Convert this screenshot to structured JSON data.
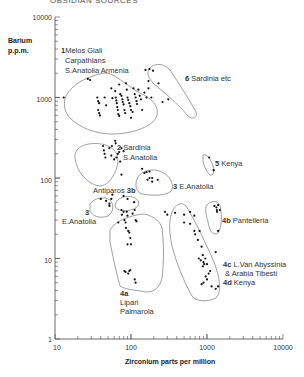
{
  "header": {
    "cut_title": "OBSIDIAN SOURCES"
  },
  "chart_data": {
    "type": "scatter",
    "title": "",
    "xlabel": "Zirconium parts per million",
    "ylabel": "Barium p.p.m.",
    "xscale": "log",
    "yscale": "log",
    "xlim": [
      10,
      10000
    ],
    "ylim": [
      1,
      10000
    ],
    "x_ticks": [
      "10",
      "100",
      "1000",
      "10000"
    ],
    "y_ticks": [
      "1",
      "10",
      "100",
      "1000",
      "10000"
    ],
    "grid": false,
    "legend": "none",
    "groups": [
      {
        "id": "1",
        "label": "1 Melos Giali Carpathians S.Anatolia Armenia",
        "label_lines": [
          "Melos Giali",
          "Carpathians",
          "S.Anatolia  Armenia"
        ],
        "points": [
          [
            13,
            1000
          ],
          [
            27,
            1700
          ],
          [
            29,
            1650
          ],
          [
            36,
            1000
          ],
          [
            37,
            900
          ],
          [
            38,
            850
          ],
          [
            37,
            700
          ],
          [
            38,
            640
          ],
          [
            39,
            600
          ],
          [
            45,
            1000
          ],
          [
            47,
            800
          ],
          [
            55,
            1300
          ],
          [
            57,
            980
          ],
          [
            62,
            1200
          ],
          [
            63,
            1000
          ],
          [
            64,
            920
          ],
          [
            65,
            850
          ],
          [
            66,
            760
          ],
          [
            67,
            700
          ],
          [
            68,
            620
          ],
          [
            70,
            1450
          ],
          [
            72,
            1100
          ],
          [
            75,
            1050
          ],
          [
            77,
            950
          ],
          [
            78,
            880
          ],
          [
            80,
            820
          ],
          [
            82,
            700
          ],
          [
            84,
            640
          ],
          [
            86,
            1500
          ],
          [
            88,
            1250
          ],
          [
            90,
            1000
          ],
          [
            92,
            930
          ],
          [
            95,
            850
          ],
          [
            98,
            780
          ],
          [
            100,
            700
          ],
          [
            105,
            660
          ],
          [
            108,
            1300
          ],
          [
            112,
            1100
          ],
          [
            115,
            1000
          ],
          [
            118,
            900
          ],
          [
            120,
            830
          ],
          [
            125,
            1250
          ],
          [
            130,
            1050
          ],
          [
            135,
            950
          ],
          [
            140,
            700
          ],
          [
            150,
            1150
          ],
          [
            160,
            1000
          ],
          [
            170,
            1300
          ],
          [
            185,
            1000
          ],
          [
            260,
            880
          ],
          [
            100,
            560
          ],
          [
            70,
            590
          ]
        ]
      },
      {
        "id": "6",
        "label": "6 Sardinia etc",
        "points": [
          [
            155,
            2200
          ],
          [
            175,
            2250
          ],
          [
            195,
            2150
          ],
          [
            170,
            1600
          ],
          [
            230,
            1500
          ],
          [
            310,
            950
          ]
        ]
      },
      {
        "id": "2",
        "label": "2 Sardinia S.Anatolia",
        "points": [
          [
            43,
            250
          ],
          [
            44,
            220
          ],
          [
            45,
            200
          ],
          [
            46,
            180
          ],
          [
            52,
            235
          ],
          [
            55,
            190
          ],
          [
            56,
            250
          ],
          [
            60,
            170
          ],
          [
            62,
            290
          ],
          [
            63,
            270
          ],
          [
            64,
            180
          ],
          [
            67,
            200
          ],
          [
            70,
            210
          ],
          [
            72,
            160
          ],
          [
            75,
            235
          ],
          [
            80,
            215
          ],
          [
            75,
            110
          ]
        ]
      },
      {
        "id": "5",
        "label": "5 Kenya",
        "points": [
          [
            1070,
            180
          ],
          [
            1220,
            125
          ]
        ]
      },
      {
        "id": "3",
        "label": "3 E.Anatolia",
        "points": [
          [
            140,
            130
          ],
          [
            150,
            115
          ],
          [
            160,
            118
          ],
          [
            175,
            120
          ],
          [
            165,
            95
          ],
          [
            175,
            100
          ],
          [
            190,
            100
          ],
          [
            190,
            90
          ],
          [
            225,
            95
          ]
        ]
      },
      {
        "id": "3b",
        "label": "Antiparos 3b",
        "points": [
          [
            80,
            60
          ],
          [
            90,
            55
          ],
          [
            110,
            50
          ]
        ]
      },
      {
        "id": "3-west",
        "label": "3 E.Anatolia",
        "points": [
          [
            40,
            55
          ],
          [
            47,
            52
          ],
          [
            52,
            48
          ],
          [
            55,
            55
          ],
          [
            57,
            62
          ],
          [
            52,
            45
          ]
        ]
      },
      {
        "id": "4a",
        "label": "4a Lipari Palmarola",
        "points": [
          [
            68,
            28
          ],
          [
            75,
            40
          ],
          [
            76,
            35
          ],
          [
            80,
            38
          ],
          [
            82,
            30
          ],
          [
            85,
            28
          ],
          [
            86,
            24
          ],
          [
            88,
            38
          ],
          [
            90,
            34
          ],
          [
            92,
            22
          ],
          [
            95,
            21
          ],
          [
            98,
            18
          ],
          [
            105,
            36
          ],
          [
            112,
            40
          ],
          [
            115,
            30
          ],
          [
            118,
            29
          ],
          [
            90,
            15
          ],
          [
            100,
            15
          ],
          [
            82,
            7
          ],
          [
            92,
            6.5
          ],
          [
            95,
            7
          ],
          [
            98,
            7.2
          ],
          [
            85,
            6.8
          ],
          [
            112,
            5.5
          ],
          [
            115,
            5
          ]
        ]
      },
      {
        "id": "4b",
        "label": "4b Pantelleria",
        "points": [
          [
            1250,
            45
          ],
          [
            1330,
            43
          ],
          [
            1350,
            40
          ],
          [
            1400,
            46
          ],
          [
            1360,
            38
          ],
          [
            1480,
            40
          ],
          [
            1400,
            22
          ]
        ]
      },
      {
        "id": "4c-4d",
        "label": "4c L.Van Abyssinia & Arabia Tibesti 4d Kenya",
        "label_lines": [
          "L.Van  Abyssinia",
          "& Arabia  Tibesti",
          "Kenya"
        ],
        "points": [
          [
            280,
            38
          ],
          [
            300,
            35
          ],
          [
            380,
            37
          ],
          [
            500,
            35
          ],
          [
            600,
            38
          ],
          [
            680,
            34
          ],
          [
            500,
            28
          ],
          [
            600,
            27
          ],
          [
            680,
            22
          ],
          [
            700,
            20
          ],
          [
            800,
            22
          ],
          [
            760,
            17
          ],
          [
            850,
            14
          ],
          [
            880,
            11
          ],
          [
            950,
            10
          ],
          [
            780,
            10
          ],
          [
            830,
            9.5
          ],
          [
            900,
            9
          ],
          [
            920,
            8.5
          ],
          [
            880,
            8
          ],
          [
            1000,
            8.5
          ],
          [
            1100,
            7
          ],
          [
            1050,
            6.5
          ],
          [
            960,
            6
          ],
          [
            1000,
            5.5
          ],
          [
            900,
            5
          ],
          [
            850,
            4.8
          ],
          [
            1150,
            4.5
          ],
          [
            1300,
            4.2
          ],
          [
            1400,
            4.5
          ],
          [
            1300,
            12
          ]
        ]
      }
    ],
    "annotations": [
      "1",
      "2",
      "3",
      "3b",
      "4a",
      "4b",
      "4c",
      "4d",
      "5",
      "6"
    ]
  },
  "plot": {
    "ylabel_line1": "Barium",
    "ylabel_line2": "p.p.m.",
    "xlabel": "Zirconium  parts per million",
    "y_tick_labels": [
      "10000",
      "1000",
      "100",
      "10",
      "1"
    ],
    "x_tick_labels": [
      "10",
      "100",
      "1000",
      "10000"
    ]
  },
  "labels": {
    "g1_num": "1",
    "g1_l1": "Melos Giali",
    "g1_l2": "Carpathians",
    "g1_l3": "S.Anatolia  Armenia",
    "g6_num": "6",
    "g6_txt": "Sardinia etc",
    "g2_num": "2",
    "g2_l1": "Sardinia",
    "g2_l2": "S.Anatolia",
    "g5_num": "5",
    "g5_txt": "Kenya",
    "g3_num": "3",
    "g3_txt": "E.Anatolia",
    "g3b_txt": "Antiparos",
    "g3b_num": "3b",
    "g3w_num": "3",
    "g3w_txt": "E.Anatolia",
    "g4b_num": "4b",
    "g4b_txt": "Pantelleria",
    "g4a_num": "4a",
    "g4a_l1": "Lipari",
    "g4a_l2": "Palmarola",
    "g4c_num": "4c",
    "g4c_l1": "L.Van  Abyssinia",
    "g4c_l2": "& Arabia  Tibesti",
    "g4d_num": "4d",
    "g4d_txt": "Kenya"
  }
}
